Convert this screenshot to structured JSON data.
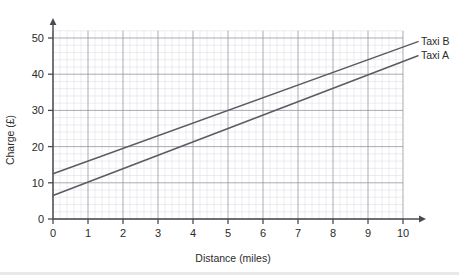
{
  "page": {
    "faint_header_text": "",
    "background": "#ffffff"
  },
  "chart_data": {
    "type": "line",
    "title": "",
    "subtitle": "",
    "xlabel": "Distance (miles)",
    "ylabel": "Charge (£)",
    "xlim": [
      0,
      10
    ],
    "ylim": [
      0,
      52
    ],
    "xticks": [
      "0",
      "1",
      "2",
      "3",
      "4",
      "5",
      "6",
      "7",
      "8",
      "9",
      "10"
    ],
    "xtick_values": [
      0,
      1,
      2,
      3,
      4,
      5,
      6,
      7,
      8,
      9,
      10
    ],
    "yticks": [
      "0",
      "10",
      "20",
      "30",
      "40",
      "50"
    ],
    "ytick_values": [
      0,
      10,
      20,
      30,
      40,
      50
    ],
    "grid": true,
    "grid_major_step_x": 1,
    "grid_minor_step_x": 0.2,
    "grid_major_step_y": 10,
    "grid_minor_step_y": 2,
    "legend_position": "right-inline",
    "x": [
      0,
      10
    ],
    "series": [
      {
        "name": "Taxi B",
        "label": "Taxi B",
        "color": "#5a5a64",
        "intercept": 12.5,
        "slope": 3.5,
        "values": [
          12.5,
          47.5
        ],
        "points": [
          [
            0,
            12.5
          ],
          [
            10,
            47.5
          ]
        ]
      },
      {
        "name": "Taxi A",
        "label": "Taxi A",
        "color": "#5a5a64",
        "intercept": 6.5,
        "slope": 3.7,
        "values": [
          6.5,
          43.5
        ],
        "points": [
          [
            0,
            6.5
          ],
          [
            10,
            43.5
          ]
        ]
      }
    ],
    "annotations": [
      {
        "text": "intersection",
        "x": 5.45,
        "y": 30.0,
        "visible": false
      }
    ],
    "colors": {
      "axis": "#4a4a52",
      "grid_major": "#9b9ba6",
      "grid_minor": "#d8d8e0",
      "line": "#5a5a64",
      "text": "#2b2b2b"
    }
  }
}
